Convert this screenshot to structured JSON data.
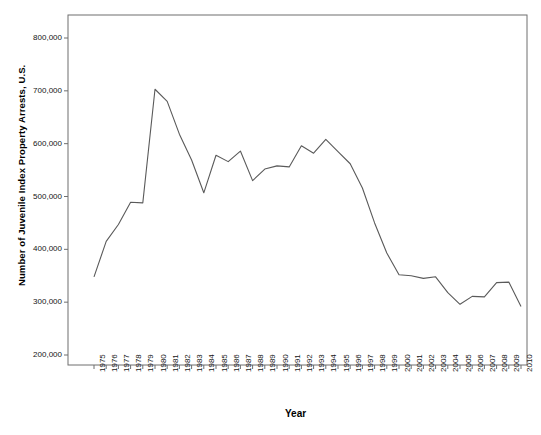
{
  "figure": {
    "ghost_header_text": "",
    "frame_color": "#6f6f6f",
    "line_color": "#5a5a5a",
    "background": "#ffffff"
  },
  "chart_data": {
    "type": "line",
    "title": "",
    "xlabel": "Year",
    "ylabel": "Number of Juvenile Index Property Arrests, U.S.",
    "xlim": [
      1975,
      2010
    ],
    "ylim": [
      200000,
      800000
    ],
    "ytick_labels": [
      "800,000",
      "700,000",
      "600,000",
      "500,000",
      "400,000",
      "300,000",
      "200,000"
    ],
    "ytick_values": [
      800000,
      700000,
      600000,
      500000,
      400000,
      300000,
      200000
    ],
    "grid": false,
    "legend": "none",
    "categories": [
      "1975",
      "1976",
      "1977",
      "1978",
      "1979",
      "1980",
      "1981",
      "1982",
      "1983",
      "1984",
      "1985",
      "1986",
      "1987",
      "1988",
      "1989",
      "1990",
      "1991",
      "1992",
      "1993",
      "1994",
      "1995",
      "1996",
      "1997",
      "1998",
      "1999",
      "2000",
      "2001",
      "2002",
      "2003",
      "2004",
      "2005",
      "2006",
      "2007",
      "2008",
      "2009",
      "2010"
    ],
    "values": [
      348000,
      415000,
      447000,
      489000,
      488000,
      703000,
      680000,
      618000,
      569000,
      507000,
      578000,
      566000,
      586000,
      530000,
      552000,
      558000,
      556000,
      596000,
      582000,
      608000,
      585000,
      562000,
      516000,
      450000,
      393000,
      352000,
      350000,
      345000,
      348000,
      318000,
      296000,
      311000,
      310000,
      337000,
      338000,
      292000
    ]
  }
}
